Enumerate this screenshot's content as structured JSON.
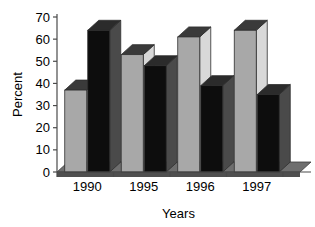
{
  "chart_data": {
    "type": "bar",
    "title": "",
    "subtitle": "",
    "xlabel": "Years",
    "ylabel": "Percent",
    "categories": [
      "1990",
      "1995",
      "1996",
      "1997"
    ],
    "series": [
      {
        "name": "series-1",
        "color": "#a8a8a8",
        "values": [
          37,
          53,
          61,
          64
        ]
      },
      {
        "name": "series-2",
        "color": "#0d0d0d",
        "values": [
          64,
          48,
          39,
          35
        ]
      }
    ],
    "ylim": [
      0,
      70
    ],
    "yticks": [
      0,
      10,
      20,
      30,
      40,
      50,
      60,
      70
    ],
    "ytick_labels": [
      "0",
      "10",
      "20",
      "30",
      "40",
      "50",
      "60",
      "70"
    ],
    "grid": false,
    "legend": false,
    "legend_position": "none",
    "style": "3d-bar",
    "colors": {
      "background": "#ffffff",
      "axis": "#4a4a4a",
      "text": "#000000",
      "floor": "#6e6e6e",
      "floor_front": "#4f4f4f",
      "bar_gray_face": "#a8a8a8",
      "bar_gray_top": "#3a3a3a",
      "bar_gray_side": "#d8d8d8",
      "bar_black_face": "#0d0d0d",
      "bar_black_top": "#2b2b2b",
      "bar_black_side": "#4a4a4a"
    }
  }
}
